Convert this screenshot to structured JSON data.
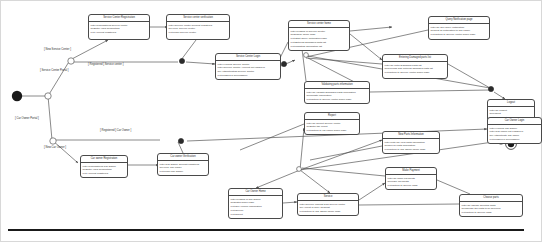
{
  "diagram": {
    "type": "uml-state-machine-diagram",
    "nodes": {
      "initial_state": {
        "label": "initial-state"
      },
      "final_state": {
        "label": "final-state"
      }
    },
    "guards": [
      {
        "id": "g_service_center_portal",
        "text": "[ Service Center Portal ]",
        "x": 40,
        "y": 69
      },
      {
        "id": "g_car_owner_portal",
        "text": "[ Car Owner Portal ]",
        "x": 15,
        "y": 117
      },
      {
        "id": "g_new_service_center",
        "text": "[ New Service Center ]",
        "x": 44,
        "y": 48
      },
      {
        "id": "g_registered_service_center",
        "text": "[ Registered ] Service center ]",
        "x": 88,
        "y": 63
      },
      {
        "id": "g_new_car_owner",
        "text": "[ New Car Owner ]",
        "x": 44,
        "y": 146
      },
      {
        "id": "g_registered_car_owner",
        "text": "[ Registered ] Car Owner ]",
        "x": 100,
        "y": 129
      }
    ],
    "states": [
      {
        "id": "service_center_registration",
        "title": "Service Center Registration",
        "lines": [
          "entry/Unregistered service center",
          "do/Enter  Valid Credentials",
          "exit/Account registered"
        ],
        "x": 88,
        "y": 14,
        "w": 62,
        "h": 26
      },
      {
        "id": "service_center_verification",
        "title": "Service center verification",
        "lines": [
          "entry/Service center account registered",
          "do/Verify Service center",
          "exit/Login Service center"
        ],
        "x": 166,
        "y": 14,
        "w": 64,
        "h": 26
      },
      {
        "id": "service_center_login",
        "title": "Service Center Login",
        "lines": [
          "entry/Verified Service Center",
          "entry/Service Center Account not logged in",
          "do/Authenticating Service Center",
          "exit/Logged in Successfully",
          ""
        ],
        "x": 215,
        "y": 53,
        "w": 66,
        "h": 27
      },
      {
        "id": "service_center_home",
        "title": "Service center home",
        "lines": [
          "entry/Logged in Service Center",
          "do/Display home  page",
          "exit/Start Query notification page",
          "exit/Entering Damaged parts list",
          "exit/Updating information list"
        ],
        "x": 288,
        "y": 20,
        "w": 62,
        "h": 29
      },
      {
        "id": "query_notification_page",
        "title": "Query Notification page",
        "lines": [
          "entry/To See query notification",
          "do/Sent all notification to Car owner",
          "exit/Return to Service center home page"
        ],
        "x": 428,
        "y": 16,
        "w": 62,
        "h": 24
      },
      {
        "id": "entering_damaged_parts_list",
        "title": "Entering Damaged parts list",
        "lines": [
          "entry/To enter Damaged parts list",
          "do/Process and entering damaged parts list",
          "exit/Return to Service center  home page"
        ],
        "x": 382,
        "y": 54,
        "w": 66,
        "h": 25
      },
      {
        "id": "validating_parts_information",
        "title": "Validating parts information",
        "lines": [
          "entry/To validate  Damaged parts information",
          "do/Update Information",
          "exit/Return to Service center home page"
        ],
        "x": 304,
        "y": 81,
        "w": 66,
        "h": 23
      },
      {
        "id": "logout",
        "title": "Logout",
        "lines": [
          "entry/To Logout",
          "do/Logout",
          "exit/Logged out Successfully"
        ],
        "x": 487,
        "y": 99,
        "w": 48,
        "h": 22
      },
      {
        "id": "car_owner_login",
        "title": "Car Owner Login",
        "lines": [
          "entry/Verified Car Owner",
          "entry/Car owner not Logged in",
          "do/Authenticate Car owner",
          "exit/Logged in Successfully"
        ],
        "x": 487,
        "y": 117,
        "w": 55,
        "h": 24
      },
      {
        "id": "car_owner_registration",
        "title": "Car owner Registration",
        "lines": [
          "entry/Unregistered Car Owner",
          "do/Enter Valid Credentials",
          "exit/Account registered"
        ],
        "x": 80,
        "y": 155,
        "w": 48,
        "h": 21
      },
      {
        "id": "car_owner_verification",
        "title": "Car owner Verification",
        "lines": [
          "entry/Car Owner account registered",
          "do/Verify Car owner",
          "exit/Login Car Owner"
        ],
        "x": 157,
        "y": 153,
        "w": 52,
        "h": 21
      },
      {
        "id": "car_owner_home",
        "title": "Car Owner Home",
        "lines": [
          "entry/Logged in Car Owner",
          "do/Distlin home page",
          "exit/See Vehicle Information",
          "exit/Service",
          "exit/Report"
        ],
        "x": 228,
        "y": 188,
        "w": 55,
        "h": 26
      },
      {
        "id": "report",
        "title": "Report",
        "lines": [
          "entry/To Report Service center",
          "do/Enter the report",
          "exit/Return to car owner home page"
        ],
        "x": 304,
        "y": 112,
        "w": 56,
        "h": 21
      },
      {
        "id": "new_parts_information",
        "title": "New Parts Information",
        "lines": [
          "entry/entry/To view parts information",
          "do/Nen  all parts information",
          "exit/Return to Car Owner home page"
        ],
        "x": 382,
        "y": 131,
        "w": 58,
        "h": 20
      },
      {
        "id": "make_payment",
        "title": "Make Payment",
        "lines": [
          "entry/To make payments",
          "do/Make payments",
          "exit/Return to Service page"
        ],
        "x": 385,
        "y": 167,
        "w": 52,
        "h": 20
      },
      {
        "id": "service",
        "title": "Service",
        "lines": [
          "entry/Service request from service center",
          "do/Accept or deny  Request",
          "exit/Return to Car Owner home page"
        ],
        "x": 297,
        "y": 193,
        "w": 62,
        "h": 20
      },
      {
        "id": "choose_parts",
        "title": "Choose parts",
        "lines": [
          "entry/To choose selected parts",
          "do/Choose the parts to be serviced",
          "exit/Return to Service page"
        ],
        "x": 459,
        "y": 194,
        "w": 64,
        "h": 20
      }
    ]
  }
}
